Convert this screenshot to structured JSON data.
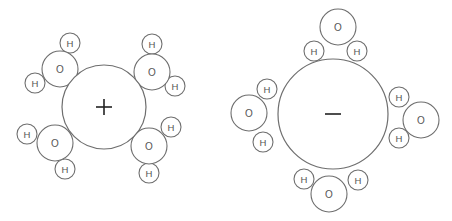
{
  "diagram": {
    "labels": {
      "oxygen": "O",
      "hydrogen": "H"
    },
    "ions": [
      {
        "id": "cation",
        "sign": "+",
        "center": [
          104,
          107
        ],
        "radius": 42,
        "waters": [
          {
            "O": [
              60,
              69
            ],
            "H": [
              [
                70,
                43
              ],
              [
                35,
                83
              ]
            ]
          },
          {
            "O": [
              152,
              72
            ],
            "H": [
              [
                152,
                44
              ],
              [
                175,
                86
              ]
            ]
          },
          {
            "O": [
              55,
              143
            ],
            "H": [
              [
                27,
                134
              ],
              [
                65,
                169
              ]
            ]
          },
          {
            "O": [
              149,
              146
            ],
            "H": [
              [
                171,
                127
              ],
              [
                149,
                173
              ]
            ]
          }
        ]
      },
      {
        "id": "anion",
        "sign": "−",
        "center": [
          333,
          114
        ],
        "radius": 55,
        "waters": [
          {
            "O": [
              338,
              27
            ],
            "H": [
              [
                314,
                51
              ],
              [
                357,
                51
              ]
            ]
          },
          {
            "O": [
              249,
              113
            ],
            "H": [
              [
                267,
                89
              ],
              [
                263,
                142
              ]
            ]
          },
          {
            "O": [
              421,
              120
            ],
            "H": [
              [
                399,
                97
              ],
              [
                399,
                138
              ]
            ]
          },
          {
            "O": [
              329,
              194
            ],
            "H": [
              [
                304,
                179
              ],
              [
                358,
                180
              ]
            ]
          }
        ]
      }
    ],
    "oxygen_radius": 18,
    "hydrogen_radius": 10,
    "colors": {
      "stroke": "#6e6e6e",
      "label": "#555555",
      "sign": "#222222",
      "background": "#ffffff"
    }
  }
}
